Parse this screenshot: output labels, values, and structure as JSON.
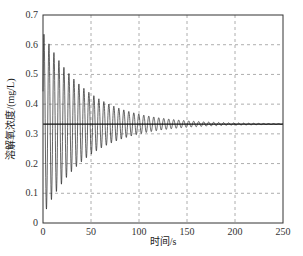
{
  "chart_data": {
    "type": "line",
    "title": "",
    "xlabel": "时间/s",
    "ylabel": "溶解氧浓度/(mg/L)",
    "xlim": [
      0,
      250
    ],
    "ylim": [
      0,
      0.7
    ],
    "xticks": [
      "0",
      "50",
      "100",
      "150",
      "200",
      "250"
    ],
    "yticks": [
      "0",
      "0.1",
      "0.2",
      "0.3",
      "0.4",
      "0.5",
      "0.6",
      "0.7"
    ],
    "grid": true,
    "legend": null,
    "series": [
      {
        "name": "damped oscillation",
        "description": "Damped oscillation around 0.333 mg/L; first peak ~0.645 near t=1s, first trough ~0.03 near t=3.5s; period ~5s; envelope decays to near zero by ~200s",
        "steady_state": 0.333,
        "initial_amplitude": 0.31,
        "period": 5.2,
        "peaks": [
          [
            1,
            0.645
          ],
          [
            6,
            0.605
          ],
          [
            11,
            0.575
          ],
          [
            16,
            0.545
          ],
          [
            21,
            0.52
          ],
          [
            26,
            0.5
          ],
          [
            31,
            0.48
          ],
          [
            36,
            0.46
          ],
          [
            41,
            0.445
          ],
          [
            46,
            0.43
          ],
          [
            100,
            0.36
          ],
          [
            150,
            0.342
          ],
          [
            200,
            0.336
          ],
          [
            250,
            0.334
          ]
        ],
        "troughs": [
          [
            3.5,
            0.03
          ],
          [
            8.5,
            0.065
          ],
          [
            13.5,
            0.1
          ],
          [
            18.5,
            0.13
          ],
          [
            23.5,
            0.15
          ],
          [
            28.5,
            0.17
          ],
          [
            33.5,
            0.19
          ],
          [
            38.5,
            0.205
          ],
          [
            43.5,
            0.22
          ],
          [
            48.5,
            0.235
          ],
          [
            100,
            0.305
          ],
          [
            150,
            0.325
          ],
          [
            200,
            0.331
          ],
          [
            250,
            0.333
          ]
        ]
      },
      {
        "name": "setpoint line",
        "values": [
          [
            0,
            0.333
          ],
          [
            250,
            0.333
          ]
        ]
      }
    ]
  },
  "axes": {
    "xlabel": "时间/s",
    "ylabel": "溶解氧浓度/(mg/L)"
  }
}
